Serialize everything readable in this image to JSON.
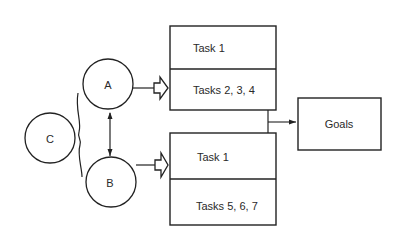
{
  "diagram": {
    "nodes": {
      "circle_a": {
        "label": "A"
      },
      "circle_b": {
        "label": "B"
      },
      "circle_c": {
        "label": "C"
      },
      "box_top": {
        "rows": [
          {
            "label": "Task 1"
          },
          {
            "label": "Tasks 2, 3, 4"
          }
        ]
      },
      "box_bottom": {
        "rows": [
          {
            "label": "Task 1"
          },
          {
            "label": "Tasks 5, 6, 7"
          }
        ]
      },
      "goals": {
        "label": "Goals"
      }
    },
    "edges": [
      {
        "from": "A",
        "to": "box_top",
        "style": "hollow-arrow"
      },
      {
        "from": "B",
        "to": "box_bottom",
        "style": "hollow-arrow"
      },
      {
        "from": "A",
        "to": "B",
        "style": "double-headed-arrow"
      },
      {
        "from": "C",
        "to": "A,B",
        "style": "brace"
      },
      {
        "from": "box_top,box_bottom",
        "to": "goals",
        "style": "arrow"
      }
    ],
    "colors": {
      "stroke": "#222222",
      "background": "#ffffff"
    }
  }
}
